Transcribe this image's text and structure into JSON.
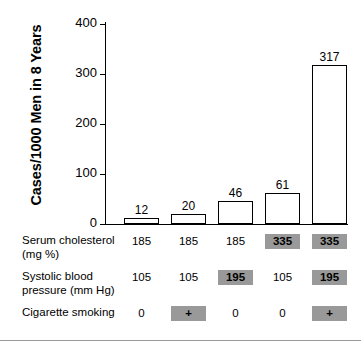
{
  "chart_data": {
    "type": "bar",
    "title": "",
    "subtitle": "",
    "xlabel": "",
    "ylabel": "Cases/1000 Men in 8 Years",
    "ylim": [
      0,
      400
    ],
    "yticks": [
      0,
      100,
      200,
      300,
      400
    ],
    "ytick_labels": [
      "0",
      "100",
      "200",
      "300",
      "400"
    ],
    "grid": false,
    "legend": null,
    "categories": [
      "1",
      "2",
      "3",
      "4",
      "5"
    ],
    "values": [
      12,
      20,
      46,
      61,
      317
    ],
    "data_labels": [
      "12",
      "20",
      "46",
      "61",
      "317"
    ],
    "bar_style": {
      "fill": "#ffffff",
      "edge": "#000000"
    },
    "risk_factor_table": {
      "rows": [
        {
          "label": "Serum cholesterol\n(mg %)",
          "label_line1": "Serum cholesterol",
          "label_line2": "(mg %)",
          "cells": [
            {
              "text": "185",
              "highlighted": false
            },
            {
              "text": "185",
              "highlighted": false
            },
            {
              "text": "185",
              "highlighted": false
            },
            {
              "text": "335",
              "highlighted": true
            },
            {
              "text": "335",
              "highlighted": true
            }
          ]
        },
        {
          "label": "Systolic blood\npressure (mm Hg)",
          "label_line1": "Systolic blood",
          "label_line2": "pressure (mm Hg)",
          "cells": [
            {
              "text": "105",
              "highlighted": false
            },
            {
              "text": "105",
              "highlighted": false
            },
            {
              "text": "195",
              "highlighted": true
            },
            {
              "text": "105",
              "highlighted": false
            },
            {
              "text": "195",
              "highlighted": true
            }
          ]
        },
        {
          "label": "Cigarette smoking",
          "label_line1": "Cigarette smoking",
          "label_line2": "",
          "cells": [
            {
              "text": "0",
              "highlighted": false
            },
            {
              "text": "+",
              "highlighted": true
            },
            {
              "text": "0",
              "highlighted": false
            },
            {
              "text": "0",
              "highlighted": false
            },
            {
              "text": "+",
              "highlighted": true
            }
          ]
        }
      ]
    },
    "colors": {
      "highlight": "#999999",
      "axis": "#000000",
      "text": "#000000",
      "rule": "#9a9a9a"
    }
  }
}
